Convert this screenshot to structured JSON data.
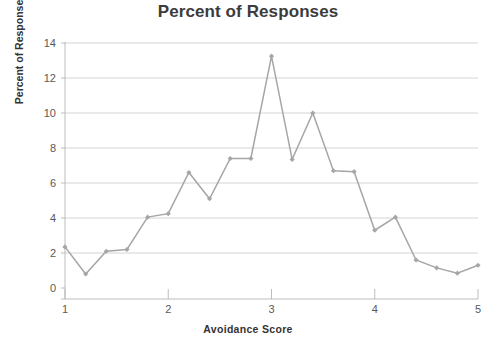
{
  "chart_data": {
    "type": "line",
    "title": "Percent of Responses",
    "xlabel": "Avoidance Score",
    "ylabel": "Percent of Responses",
    "xlim": [
      1,
      5
    ],
    "ylim": [
      0,
      14
    ],
    "grid": true,
    "legend": false,
    "x_ticks": [
      1,
      2,
      3,
      4,
      5
    ],
    "x_tick_labels": [
      "1",
      "2",
      "3",
      "4",
      "5"
    ],
    "y_ticks": [
      0,
      2,
      4,
      6,
      8,
      10,
      12,
      14
    ],
    "y_tick_labels": [
      "0",
      "2",
      "4",
      "6",
      "8",
      "10",
      "12",
      "14"
    ],
    "series_color": "#a6a6a6",
    "marker": "diamond",
    "x": [
      1.0,
      1.2,
      1.4,
      1.6,
      1.8,
      2.0,
      2.2,
      2.4,
      2.6,
      2.8,
      3.0,
      3.2,
      3.4,
      3.6,
      3.8,
      4.0,
      4.2,
      4.4,
      4.6,
      4.8,
      5.0
    ],
    "values": [
      2.35,
      0.8,
      2.1,
      2.2,
      4.05,
      4.25,
      6.6,
      5.1,
      7.4,
      7.4,
      13.25,
      7.35,
      10.0,
      6.7,
      6.65,
      3.3,
      4.05,
      1.6,
      1.15,
      0.85,
      1.3
    ]
  },
  "style": {
    "background": "#ffffff",
    "title_color": "#3c3c3c",
    "axis_label_color": "#333333",
    "tick_color": "#595959",
    "gridline_color": "#c9c9c9",
    "axis_color": "#b5b5b5"
  }
}
